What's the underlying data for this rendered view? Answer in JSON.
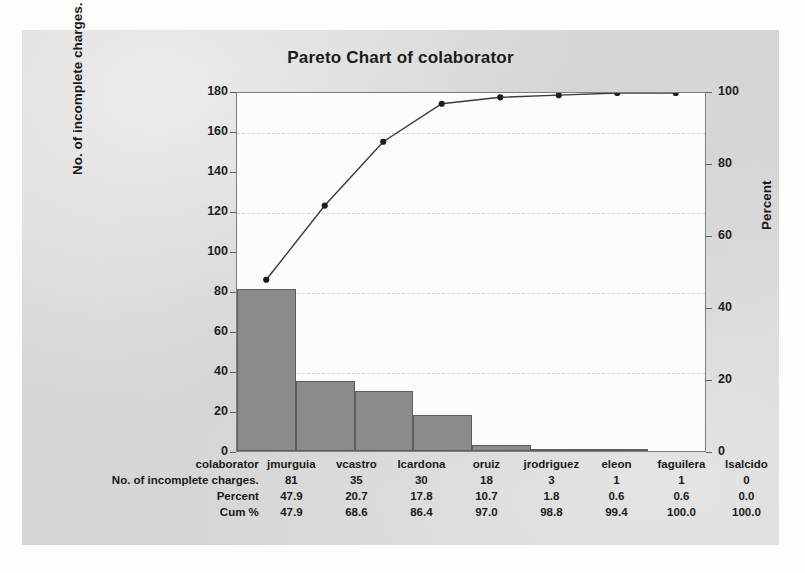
{
  "chart_data": {
    "type": "bar",
    "title": "Pareto Chart of colaborator",
    "xlabel": "colaborator",
    "ylabel": "No. of incomplete charges.",
    "y2label": "Percent",
    "ylim": [
      0,
      180
    ],
    "y2lim": [
      0,
      100
    ],
    "ytick_step": 20,
    "y2tick_step": 20,
    "grid": true,
    "legend": "none",
    "categories": [
      "jmurguia",
      "vcastro",
      "lcardona",
      "oruiz",
      "jrodriguez",
      "eleon",
      "faguilera",
      "lsalcido"
    ],
    "values": [
      81,
      35,
      30,
      18,
      3,
      1,
      1,
      0
    ],
    "percent": [
      47.9,
      20.7,
      17.8,
      10.7,
      1.8,
      0.6,
      0.6,
      0.0
    ],
    "cum_percent": [
      47.9,
      68.6,
      86.4,
      97.0,
      98.8,
      99.4,
      100.0,
      100.0
    ],
    "yticks": [
      "0",
      "20",
      "40",
      "60",
      "80",
      "100",
      "120",
      "140",
      "160",
      "180"
    ],
    "y2ticks": [
      "0",
      "20",
      "40",
      "60",
      "80",
      "100"
    ],
    "series": [
      {
        "name": "No. of incomplete charges.",
        "type": "bar",
        "axis": "left",
        "values": [
          81,
          35,
          30,
          18,
          3,
          1,
          1,
          0
        ]
      },
      {
        "name": "Cum %",
        "type": "line",
        "axis": "right",
        "values": [
          47.9,
          68.6,
          86.4,
          97.0,
          98.8,
          99.4,
          100.0,
          100.0
        ]
      }
    ]
  },
  "table": {
    "rows": [
      {
        "label": "colaborator",
        "cells": [
          "jmurguia",
          "vcastro",
          "lcardona",
          "oruiz",
          "jrodriguez",
          "eleon",
          "faguilera",
          "lsalcido"
        ]
      },
      {
        "label": "No. of incomplete charges.",
        "cells": [
          "81",
          "35",
          "30",
          "18",
          "3",
          "1",
          "1",
          "0"
        ]
      },
      {
        "label": "Percent",
        "cells": [
          "47.9",
          "20.7",
          "17.8",
          "10.7",
          "1.8",
          "0.6",
          "0.6",
          "0.0"
        ]
      },
      {
        "label": "Cum %",
        "cells": [
          "47.9",
          "68.6",
          "86.4",
          "97.0",
          "98.8",
          "99.4",
          "100.0",
          "100.0"
        ]
      }
    ]
  },
  "colors": {
    "figure_background": "#d6d6d6",
    "plot_background": "#fcfcfb",
    "bar_fill": "#8b8b8b",
    "bar_edge": "#5e5e5e",
    "line": "#3a3a3a",
    "marker": "#1f1f1f",
    "grid": "#d3d3cf",
    "text": "#1a1a1a"
  }
}
